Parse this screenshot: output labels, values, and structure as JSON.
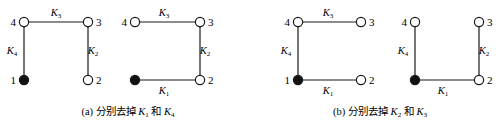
{
  "colors": {
    "stroke": "#1a1a1a",
    "filled_node": "#111111",
    "empty_node": "#ffffff",
    "background": "#ffffff"
  },
  "panels": [
    {
      "id": "a-left",
      "nodes": [
        {
          "id": "1",
          "x": 24,
          "y": 80,
          "filled": true,
          "label_side": "left"
        },
        {
          "id": "2",
          "x": 88,
          "y": 80,
          "filled": false,
          "label_side": "right"
        },
        {
          "id": "3",
          "x": 88,
          "y": 22,
          "filled": false,
          "label_side": "right"
        },
        {
          "id": "4",
          "x": 24,
          "y": 22,
          "filled": false,
          "label_side": "left"
        }
      ],
      "edges": [
        {
          "from": "4",
          "to": "3",
          "label": "K",
          "sub": "3",
          "lx": 56,
          "ly": 16
        },
        {
          "from": "3",
          "to": "2",
          "label": "K",
          "sub": "2",
          "lx": 93,
          "ly": 54
        },
        {
          "from": "4",
          "to": "1",
          "label": "K",
          "sub": "4",
          "lx": 12,
          "ly": 54
        }
      ]
    },
    {
      "id": "a-right",
      "nodes": [
        {
          "id": "1",
          "x": 135,
          "y": 80,
          "filled": true,
          "label_side": "none"
        },
        {
          "id": "2",
          "x": 200,
          "y": 80,
          "filled": false,
          "label_side": "right"
        },
        {
          "id": "3",
          "x": 200,
          "y": 22,
          "filled": false,
          "label_side": "right"
        },
        {
          "id": "4",
          "x": 135,
          "y": 22,
          "filled": false,
          "label_side": "left"
        }
      ],
      "edges": [
        {
          "from": "4",
          "to": "3",
          "label": "K",
          "sub": "3",
          "lx": 164,
          "ly": 16
        },
        {
          "from": "3",
          "to": "2",
          "label": "K",
          "sub": "2",
          "lx": 205,
          "ly": 54
        },
        {
          "from": "1",
          "to": "2",
          "label": "K",
          "sub": "1",
          "lx": 164,
          "ly": 94
        }
      ]
    },
    {
      "id": "b-left",
      "nodes": [
        {
          "id": "1",
          "x": 298,
          "y": 80,
          "filled": true,
          "label_side": "left"
        },
        {
          "id": "2",
          "x": 361,
          "y": 80,
          "filled": false,
          "label_side": "right"
        },
        {
          "id": "3",
          "x": 361,
          "y": 22,
          "filled": false,
          "label_side": "right"
        },
        {
          "id": "4",
          "x": 298,
          "y": 22,
          "filled": false,
          "label_side": "left"
        }
      ],
      "edges": [
        {
          "from": "4",
          "to": "3",
          "label": "K",
          "sub": "3",
          "lx": 328,
          "ly": 16
        },
        {
          "from": "4",
          "to": "1",
          "label": "K",
          "sub": "4",
          "lx": 286,
          "ly": 54
        },
        {
          "from": "1",
          "to": "2",
          "label": "K",
          "sub": "1",
          "lx": 328,
          "ly": 94
        }
      ]
    },
    {
      "id": "b-right",
      "nodes": [
        {
          "id": "1",
          "x": 415,
          "y": 80,
          "filled": true,
          "label_side": "none"
        },
        {
          "id": "2",
          "x": 479,
          "y": 80,
          "filled": false,
          "label_side": "right"
        },
        {
          "id": "3",
          "x": 479,
          "y": 22,
          "filled": false,
          "label_side": "right"
        },
        {
          "id": "4",
          "x": 415,
          "y": 22,
          "filled": false,
          "label_side": "left"
        }
      ],
      "edges": [
        {
          "from": "4",
          "to": "1",
          "label": "K",
          "sub": "4",
          "lx": 403,
          "ly": 54
        },
        {
          "from": "3",
          "to": "2",
          "label": "K",
          "sub": "2",
          "lx": 484,
          "ly": 54
        },
        {
          "from": "1",
          "to": "2",
          "label": "K",
          "sub": "1",
          "lx": 443,
          "ly": 94
        }
      ]
    }
  ],
  "captions": [
    {
      "id": "a",
      "prefix": "(a) 分别去掉 ",
      "k1": "K",
      "s1": "1",
      "mid": " 和 ",
      "k2": "K",
      "s2": "4",
      "x": 128,
      "y": 115
    },
    {
      "id": "b",
      "prefix": "(b) 分别去掉 ",
      "k1": "K",
      "s1": "2",
      "mid": " 和 ",
      "k2": "K",
      "s2": "3",
      "x": 380,
      "y": 115
    }
  ]
}
